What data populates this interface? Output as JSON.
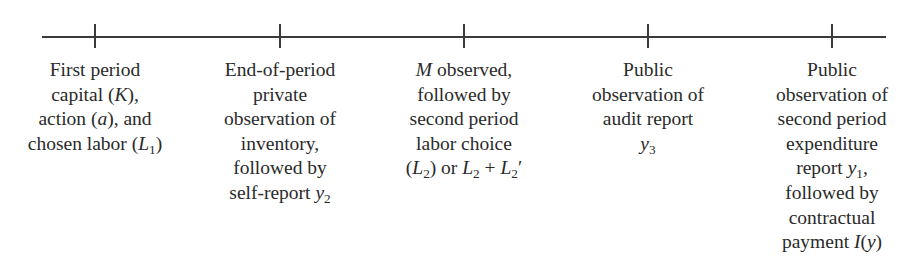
{
  "diagram": {
    "type": "timeline",
    "axis": {
      "x_start": 42,
      "x_end": 886,
      "y": 37,
      "color": "#3a3a3a"
    },
    "ticks": [
      95,
      280,
      464,
      648,
      832
    ],
    "events": [
      {
        "tick_x": 95,
        "lines": [
          "First period",
          "capital (K),",
          "action (a), and",
          "chosen labor (L1)"
        ]
      },
      {
        "tick_x": 280,
        "lines": [
          "End-of-period",
          "private",
          "observation of",
          "inventory,",
          "followed by",
          "self-report y2"
        ]
      },
      {
        "tick_x": 464,
        "lines": [
          "M observed,",
          "followed by",
          "second period",
          "labor choice",
          "(L2) or L2 + L2′"
        ]
      },
      {
        "tick_x": 648,
        "lines": [
          "Public",
          "observation of",
          "audit report",
          "y3"
        ]
      },
      {
        "tick_x": 832,
        "lines": [
          "Public",
          "observation of",
          "second period",
          "expenditure",
          "report y1,",
          "followed by",
          "contractual",
          "payment I(y)"
        ]
      }
    ]
  }
}
